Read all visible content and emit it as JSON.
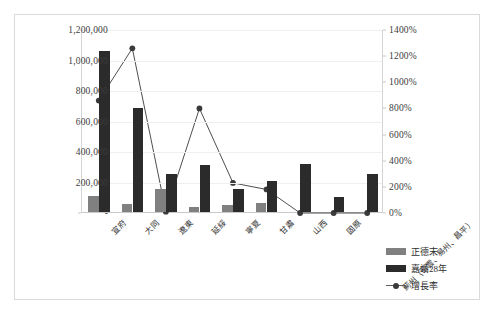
{
  "chart_data": {
    "type": "bar",
    "title": "",
    "subtitle": "",
    "xlabel": "",
    "ylabel": "",
    "y2label": "",
    "grid": true,
    "legend_position": "bottom-right",
    "categories": [
      "宣府",
      "大同",
      "遼東",
      "延綏",
      "寧夏",
      "甘肅",
      "山西",
      "固原",
      "薊州（密雲、易州、昌平）"
    ],
    "series": [
      {
        "name": "正德末",
        "type": "bar",
        "axis": "left",
        "color": "#808080",
        "values": [
          102000,
          52000,
          150000,
          36000,
          48000,
          62000,
          0,
          0,
          0
        ]
      },
      {
        "name": "嘉靖28年",
        "type": "bar",
        "axis": "left",
        "color": "#2b2b2b",
        "values": [
          1058000,
          685000,
          250000,
          310000,
          150000,
          205000,
          318000,
          98000,
          250000
        ]
      },
      {
        "name": "增長率",
        "type": "line",
        "axis": "right",
        "color": "#3a3a3a",
        "values": [
          860,
          1260,
          10,
          800,
          230,
          180,
          0,
          0,
          0
        ]
      }
    ],
    "left_axis": {
      "ticks": [
        "-",
        "200,000",
        "400,000",
        "600,000",
        "800,000",
        "1,000,000",
        "1,200,000"
      ],
      "values": [
        0,
        200000,
        400000,
        600000,
        800000,
        1000000,
        1200000
      ],
      "min": 0,
      "max": 1200000
    },
    "right_axis": {
      "ticks": [
        "0%",
        "200%",
        "400%",
        "600%",
        "800%",
        "1000%",
        "1200%",
        "1400%"
      ],
      "values": [
        0,
        200,
        400,
        600,
        800,
        1000,
        1200,
        1400
      ],
      "min": 0,
      "max": 1400
    }
  },
  "legend": {
    "items": [
      {
        "label": "正德末",
        "marker": "bar-swatch-gray"
      },
      {
        "label": "嘉靖28年",
        "marker": "bar-swatch-black"
      },
      {
        "label": "增長率",
        "marker": "line-marker"
      }
    ]
  }
}
